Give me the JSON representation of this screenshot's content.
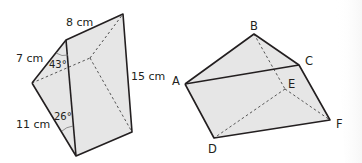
{
  "colors": {
    "face_fill": "#e6e6e6",
    "edge": "#231f20",
    "hidden_edge": "#555555",
    "background": "#ffffff"
  },
  "left_prism": {
    "labels": {
      "top_edge": "8 cm",
      "upper_left_edge": "7 cm",
      "lower_left_edge": "11 cm",
      "right_edge": "15 cm",
      "upper_angle": "43°",
      "lower_angle": "26°"
    }
  },
  "right_prism": {
    "vertices": {
      "A": "A",
      "B": "B",
      "C": "C",
      "D": "D",
      "E": "E",
      "F": "F"
    }
  }
}
